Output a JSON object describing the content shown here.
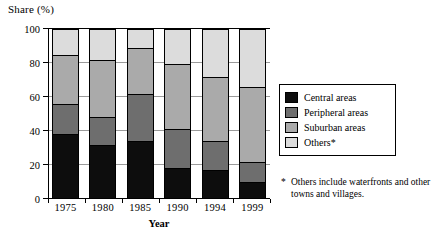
{
  "chart_data": {
    "type": "bar",
    "subtype": "stacked-bar-100",
    "title": "",
    "xlabel": "Year",
    "ylabel": "Share (%)",
    "ylim": [
      0,
      100
    ],
    "yticks": [
      0,
      20,
      40,
      60,
      80,
      100
    ],
    "grid": true,
    "legend_position": "right",
    "categories": [
      "1975",
      "1980",
      "1985",
      "1990",
      "1994",
      "1999"
    ],
    "series": [
      {
        "name": "Central areas",
        "color": "#0d0d0d",
        "values": [
          38,
          32,
          34,
          18.5,
          17,
          10
        ]
      },
      {
        "name": "Peripheral areas",
        "color": "#6e6e6e",
        "values": [
          18,
          16.5,
          28,
          22.5,
          17,
          12
        ]
      },
      {
        "name": "Suburban areas",
        "color": "#aaaaaa",
        "values": [
          29,
          33.5,
          27,
          38.5,
          38,
          44
        ]
      },
      {
        "name": "Others*",
        "color": "#dcdcdc",
        "values": [
          15,
          18,
          11,
          20.5,
          28,
          34
        ]
      }
    ],
    "cumulative_tops": {
      "1975": [
        38,
        56,
        85,
        100
      ],
      "1980": [
        32,
        48.5,
        82,
        100
      ],
      "1985": [
        34,
        62,
        89,
        100
      ],
      "1990": [
        18.5,
        41,
        79.5,
        100
      ],
      "1994": [
        17,
        34,
        72,
        100
      ],
      "1999": [
        10,
        22,
        66,
        100
      ]
    },
    "annotations": [
      "* Others include waterfronts and other towns and villages."
    ]
  },
  "axes": {
    "y_title": "Share (%)",
    "x_title": "Year",
    "y_tick_labels": [
      "100",
      "80",
      "60",
      "40",
      "20",
      "0"
    ],
    "x_tick_labels": [
      "1975",
      "1980",
      "1985",
      "1990",
      "1994",
      "1999"
    ]
  },
  "legend": {
    "items": [
      {
        "label": "Central areas",
        "color": "#0d0d0d"
      },
      {
        "label": "Peripheral areas",
        "color": "#6e6e6e"
      },
      {
        "label": "Suburban areas",
        "color": "#aaaaaa"
      },
      {
        "label": "Others*",
        "color": "#dcdcdc"
      }
    ]
  },
  "footnote": {
    "marker": "*",
    "text": "Others include waterfronts and other towns and villages."
  }
}
